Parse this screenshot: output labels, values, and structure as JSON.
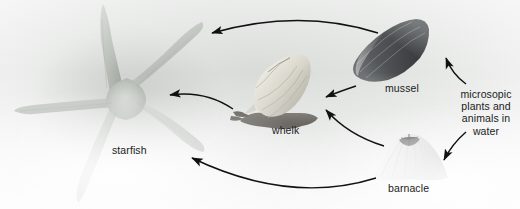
{
  "diagram": {
    "background_color": "#e6e8e6",
    "line_color": "#141414",
    "labels": {
      "starfish": "starfish",
      "whelk": "whelk",
      "mussel": "mussel",
      "barnacle": "barnacle",
      "plankton": "microsopic plants and animals in water"
    },
    "organisms": [
      {
        "id": "starfish",
        "label": "starfish",
        "color": "#b3b8b2",
        "role": "top predator"
      },
      {
        "id": "whelk",
        "label": "whelk",
        "color": "#cfcdc4",
        "role": "predator"
      },
      {
        "id": "mussel",
        "label": "mussel",
        "color": "#3d3f40",
        "role": "filter feeder"
      },
      {
        "id": "barnacle",
        "label": "barnacle",
        "color": "#d5d7d6",
        "role": "filter feeder"
      },
      {
        "id": "plankton",
        "label": "microsopic plants and animals in water",
        "color": "#1b1b1b",
        "role": "producer / base"
      }
    ],
    "arrows": [
      {
        "id": "mussel-to-starfish",
        "from": "mussel",
        "to": "starfish",
        "shape": "long-arc-top"
      },
      {
        "id": "whelk-to-starfish",
        "from": "whelk",
        "to": "starfish",
        "shape": "short-arc-middle"
      },
      {
        "id": "barnacle-to-starfish",
        "from": "barnacle",
        "to": "starfish",
        "shape": "long-arc-bottom"
      },
      {
        "id": "mussel-to-whelk",
        "from": "mussel",
        "to": "whelk",
        "shape": "short-arc"
      },
      {
        "id": "barnacle-to-whelk",
        "from": "barnacle",
        "to": "whelk",
        "shape": "curved-arc"
      },
      {
        "id": "plankton-to-mussel",
        "from": "plankton",
        "to": "mussel",
        "shape": "brace-arc-up"
      },
      {
        "id": "plankton-to-barnacle",
        "from": "plankton",
        "to": "barnacle",
        "shape": "brace-arc-down"
      }
    ]
  }
}
